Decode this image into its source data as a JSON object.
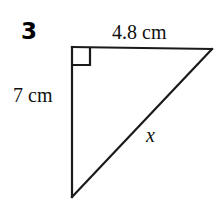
{
  "figure": {
    "problem_number": "3",
    "shape": "right-triangle",
    "stroke_color": "#1a1a1a",
    "background_color": "#ffffff",
    "labels": {
      "top_side": "4.8 cm",
      "left_side": "7 cm",
      "hypotenuse": "x"
    },
    "geometry": {
      "vertices": {
        "top_left": [
          72,
          47
        ],
        "top_right": [
          212,
          49
        ],
        "bottom_left": [
          72,
          197
        ]
      },
      "right_angle_vertex": "top_left",
      "right_angle_marker_size": 18
    },
    "measurements": {
      "top_side_length": 4.8,
      "left_side_length": 7,
      "units": "cm",
      "unknown_side": "x"
    }
  }
}
